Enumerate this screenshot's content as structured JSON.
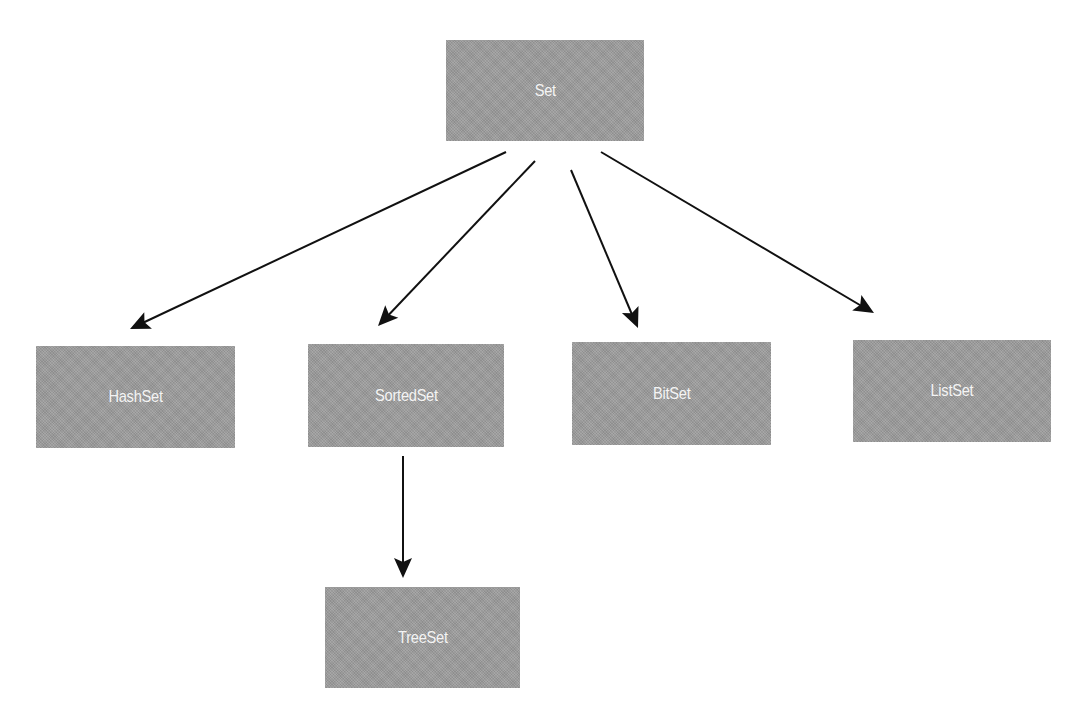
{
  "diagram": {
    "type": "class-hierarchy",
    "colors": {
      "node_fill": "#9c9c9c",
      "node_text": "#f4f4f4",
      "edge": "#111111"
    },
    "nodes": [
      {
        "id": "set",
        "label": "Set"
      },
      {
        "id": "hashset",
        "label": "HashSet"
      },
      {
        "id": "sortedset",
        "label": "SortedSet"
      },
      {
        "id": "bitset",
        "label": "BitSet"
      },
      {
        "id": "listset",
        "label": "ListSet"
      },
      {
        "id": "treeset",
        "label": "TreeSet"
      }
    ],
    "edges": [
      {
        "from": "set",
        "to": "hashset"
      },
      {
        "from": "set",
        "to": "sortedset"
      },
      {
        "from": "set",
        "to": "bitset"
      },
      {
        "from": "set",
        "to": "listset"
      },
      {
        "from": "sortedset",
        "to": "treeset"
      }
    ]
  }
}
